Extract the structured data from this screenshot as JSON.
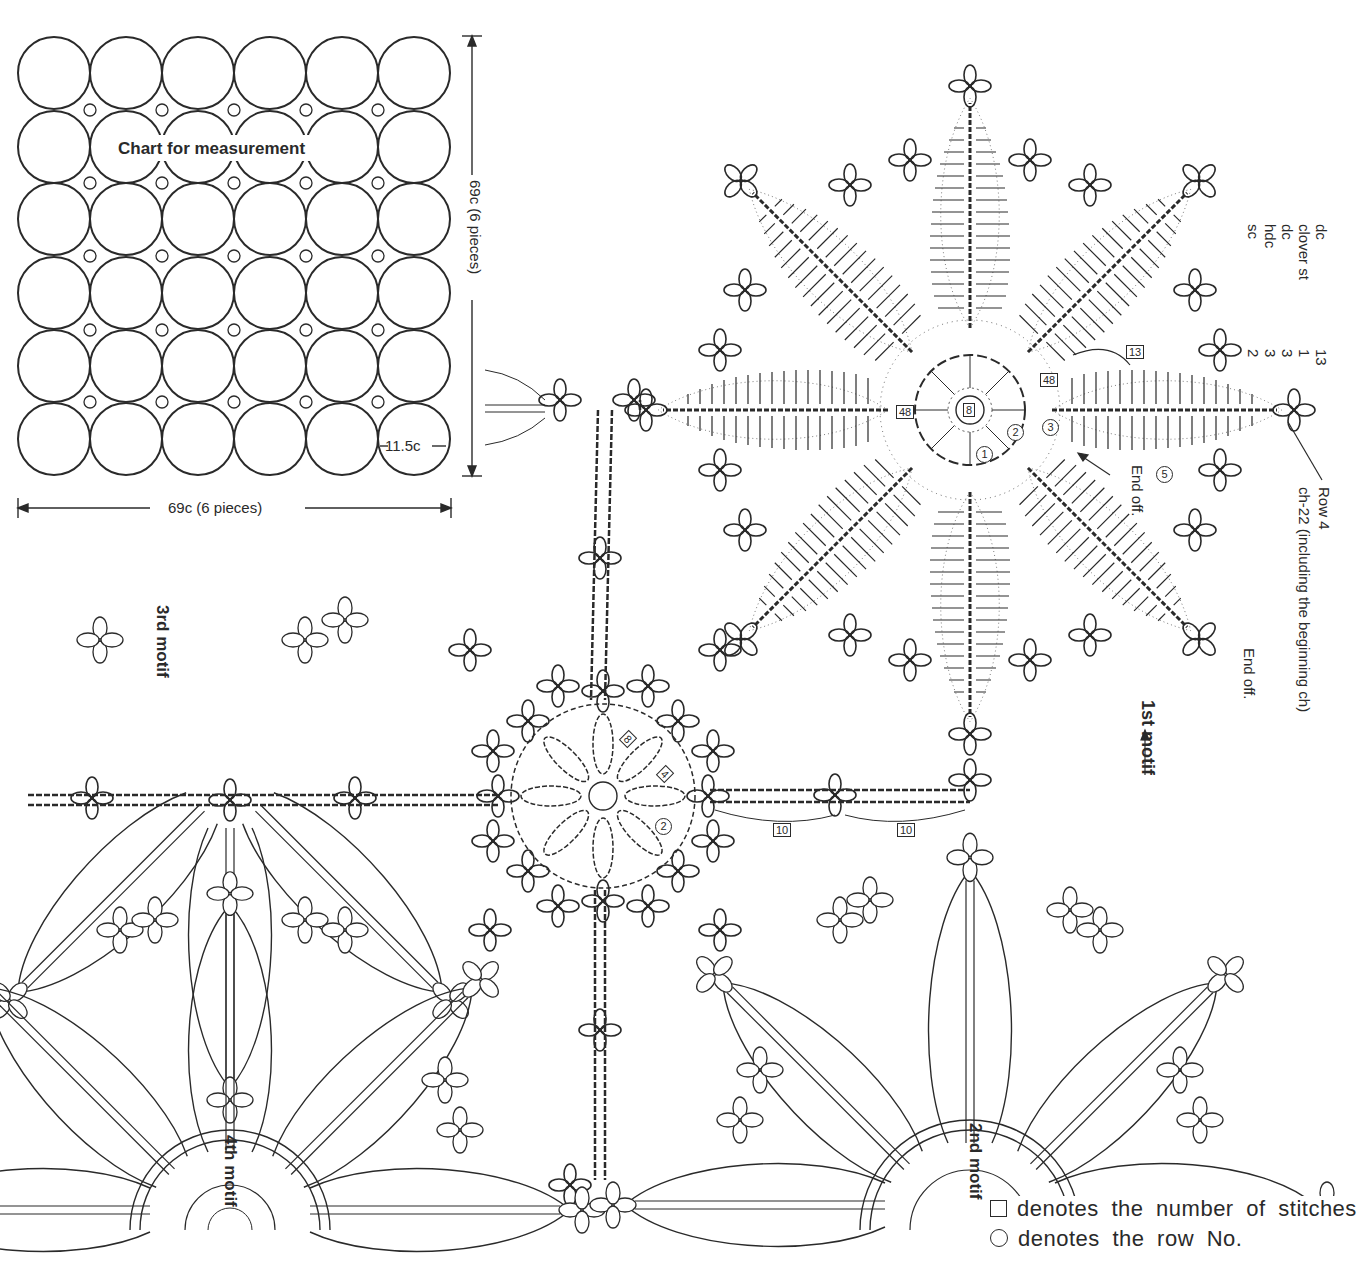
{
  "measurement_chart": {
    "title": "Chart for measurement",
    "grid": {
      "rows": 6,
      "cols": 6
    },
    "motif_diameter": "11.5c",
    "width_label": "69c (6 pieces)",
    "height_label": "69c (6 pieces)"
  },
  "stitch_legend": {
    "rows": [
      {
        "stitch": "dc",
        "count": "13"
      },
      {
        "stitch": "clover st",
        "count": "1"
      },
      {
        "stitch": "dc",
        "count": "3"
      },
      {
        "stitch": "hdc",
        "count": "3"
      },
      {
        "stitch": "sc",
        "count": "2"
      }
    ]
  },
  "first_motif": {
    "label": "1st motif",
    "center_stitches": "8",
    "petal_stitches_left": "48",
    "petal_stitches_right": "48",
    "petal_top_stitches": "13",
    "row_numbers": [
      "1",
      "2",
      "3",
      "5"
    ],
    "annotations": {
      "end_off_1": "End off.",
      "end_off_2": "End off.",
      "row4": "Row 4",
      "row4_detail": "ch-22 (including the beginning ch)"
    }
  },
  "joining_motif": {
    "box_8": "8",
    "box_4": "4",
    "row_2": "2",
    "chain_count_1": "10",
    "chain_count_2": "10"
  },
  "motif_labels": {
    "second": "2nd motif",
    "third": "3rd motif",
    "fourth": "4th motif"
  },
  "notes": {
    "square_symbol": "denotes the number of stitches",
    "circle_symbol": "denotes the row No."
  },
  "colors": {
    "ink": "#2a2a2a",
    "paper": "#ffffff"
  }
}
